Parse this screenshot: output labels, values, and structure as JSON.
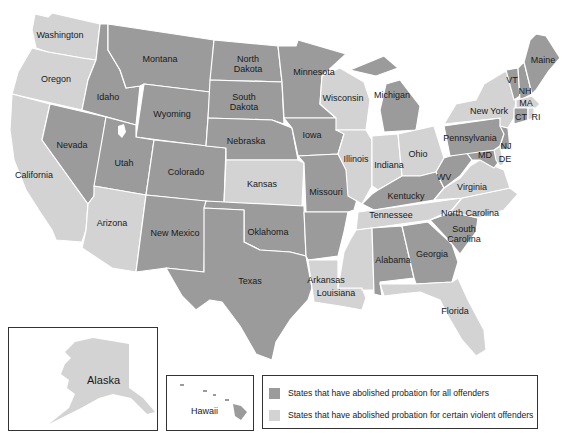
{
  "colors": {
    "all_offenders": "#9b9b9b",
    "certain_violent": "#d3d3d3",
    "border": "#ffffff",
    "background": "#ffffff"
  },
  "legend": {
    "items": [
      {
        "category": "all_offenders",
        "label": "States that have abolished probation for all offenders",
        "color": "#9b9b9b"
      },
      {
        "category": "certain_violent",
        "label": "States that have abolished probation for certain violent offenders",
        "color": "#d3d3d3"
      }
    ]
  },
  "insets": {
    "alaska": {
      "label": "Alaska",
      "category": "certain_violent"
    },
    "hawaii": {
      "label": "Hawaii",
      "category": "all_offenders"
    }
  },
  "states": [
    {
      "name": "Washington",
      "label": "Washington",
      "category": "certain_violent"
    },
    {
      "name": "Oregon",
      "label": "Oregon",
      "category": "certain_violent"
    },
    {
      "name": "California",
      "label": "California",
      "category": "certain_violent"
    },
    {
      "name": "Idaho",
      "label": "Idaho",
      "category": "all_offenders"
    },
    {
      "name": "Nevada",
      "label": "Nevada",
      "category": "all_offenders"
    },
    {
      "name": "Montana",
      "label": "Montana",
      "category": "all_offenders"
    },
    {
      "name": "Wyoming",
      "label": "Wyoming",
      "category": "all_offenders"
    },
    {
      "name": "Utah",
      "label": "Utah",
      "category": "all_offenders"
    },
    {
      "name": "Colorado",
      "label": "Colorado",
      "category": "all_offenders"
    },
    {
      "name": "Arizona",
      "label": "Arizona",
      "category": "certain_violent"
    },
    {
      "name": "New Mexico",
      "label": "New Mexico",
      "category": "all_offenders"
    },
    {
      "name": "North Dakota",
      "label": "North Dakota",
      "category": "all_offenders"
    },
    {
      "name": "South Dakota",
      "label": "South Dakota",
      "category": "all_offenders"
    },
    {
      "name": "Nebraska",
      "label": "Nebraska",
      "category": "all_offenders"
    },
    {
      "name": "Kansas",
      "label": "Kansas",
      "category": "certain_violent"
    },
    {
      "name": "Oklahoma",
      "label": "Oklahoma",
      "category": "all_offenders"
    },
    {
      "name": "Texas",
      "label": "Texas",
      "category": "all_offenders"
    },
    {
      "name": "Minnesota",
      "label": "Minnesota",
      "category": "all_offenders"
    },
    {
      "name": "Iowa",
      "label": "Iowa",
      "category": "all_offenders"
    },
    {
      "name": "Missouri",
      "label": "Missouri",
      "category": "all_offenders"
    },
    {
      "name": "Arkansas",
      "label": "Arkansas",
      "category": "all_offenders"
    },
    {
      "name": "Louisiana",
      "label": "Louisiana",
      "category": "certain_violent"
    },
    {
      "name": "Wisconsin",
      "label": "Wisconsin",
      "category": "certain_violent"
    },
    {
      "name": "Illinois",
      "label": "Illinois",
      "category": "certain_violent"
    },
    {
      "name": "Michigan",
      "label": "Michigan",
      "category": "all_offenders"
    },
    {
      "name": "Indiana",
      "label": "Indiana",
      "category": "certain_violent"
    },
    {
      "name": "Ohio",
      "label": "Ohio",
      "category": "certain_violent"
    },
    {
      "name": "Kentucky",
      "label": "Kentucky",
      "category": "all_offenders"
    },
    {
      "name": "Tennessee",
      "label": "Tennessee",
      "category": "certain_violent"
    },
    {
      "name": "Mississippi",
      "label": "Mississippi",
      "category": "certain_violent"
    },
    {
      "name": "Alabama",
      "label": "Alabama",
      "category": "all_offenders"
    },
    {
      "name": "Georgia",
      "label": "Georgia",
      "category": "all_offenders"
    },
    {
      "name": "Florida",
      "label": "Florida",
      "category": "certain_violent"
    },
    {
      "name": "South Carolina",
      "label": "South Carolina",
      "category": "all_offenders"
    },
    {
      "name": "North Carolina",
      "label": "North Carolina",
      "category": "certain_violent"
    },
    {
      "name": "Virginia",
      "label": "Virginia",
      "category": "certain_violent"
    },
    {
      "name": "West Virginia",
      "label": "WV",
      "category": "all_offenders"
    },
    {
      "name": "Maryland",
      "label": "MD",
      "category": "all_offenders"
    },
    {
      "name": "Delaware",
      "label": "DE",
      "category": "certain_violent"
    },
    {
      "name": "Pennsylvania",
      "label": "Pennsylvania",
      "category": "all_offenders"
    },
    {
      "name": "New Jersey",
      "label": "NJ",
      "category": "all_offenders"
    },
    {
      "name": "New York",
      "label": "New York",
      "category": "certain_violent"
    },
    {
      "name": "Connecticut",
      "label": "CT",
      "category": "all_offenders"
    },
    {
      "name": "Rhode Island",
      "label": "RI",
      "category": "certain_violent"
    },
    {
      "name": "Massachusetts",
      "label": "MA",
      "category": "certain_violent"
    },
    {
      "name": "Vermont",
      "label": "VT",
      "category": "all_offenders"
    },
    {
      "name": "New Hampshire",
      "label": "NH",
      "category": "all_offenders"
    },
    {
      "name": "Maine",
      "label": "Maine",
      "category": "all_offenders"
    }
  ]
}
